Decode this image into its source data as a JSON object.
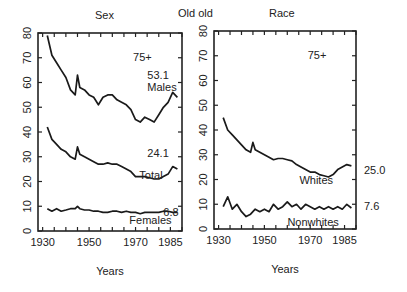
{
  "header": {
    "title": "Old old",
    "left_panel_title": "Sex",
    "right_panel_title": "Race"
  },
  "chart_data": [
    {
      "type": "line",
      "title": "Sex",
      "annotation": "75+",
      "xlabel": "Years",
      "ylabel": "",
      "xlim": [
        1928,
        1990
      ],
      "ylim": [
        0,
        80
      ],
      "xticks": [
        1930,
        1950,
        1970,
        1985
      ],
      "yticks": [
        0,
        10,
        20,
        30,
        40,
        50,
        60,
        70,
        80
      ],
      "grid": false,
      "x": [
        1932,
        1934,
        1936,
        1938,
        1940,
        1942,
        1944,
        1945,
        1946,
        1948,
        1950,
        1952,
        1954,
        1956,
        1958,
        1960,
        1962,
        1964,
        1966,
        1968,
        1970,
        1972,
        1974,
        1976,
        1978,
        1980,
        1982,
        1984,
        1986,
        1988
      ],
      "series": [
        {
          "name": "Males",
          "end_label": "53.1",
          "values": [
            79,
            71,
            68,
            65,
            62,
            57,
            55,
            63,
            58,
            57,
            55,
            54,
            51,
            54,
            55,
            55,
            53,
            52,
            51,
            49,
            45,
            44,
            46,
            45,
            44,
            47,
            50,
            52,
            56,
            54
          ]
        },
        {
          "name": "Total",
          "end_label": "24.1",
          "values": [
            42,
            37,
            35,
            33,
            32,
            30,
            29,
            34,
            31,
            30,
            29,
            28,
            27,
            27,
            27.5,
            27,
            27,
            26,
            25,
            24,
            22,
            22,
            22,
            21.5,
            21,
            21,
            22,
            23,
            26,
            25
          ]
        },
        {
          "name": "Females",
          "end_label": "6.8",
          "values": [
            9,
            8,
            9,
            8,
            8.5,
            9,
            9,
            10,
            9,
            8.5,
            8.5,
            8,
            8,
            7.5,
            7.5,
            8,
            8,
            7.5,
            8,
            7.5,
            7.5,
            7,
            7.5,
            7.5,
            7.5,
            7.5,
            8,
            8,
            7.5,
            7.5
          ]
        }
      ]
    },
    {
      "type": "line",
      "title": "Race",
      "annotation": "75+",
      "xlabel": "Years",
      "ylabel": "",
      "xlim": [
        1928,
        1990
      ],
      "ylim": [
        0,
        80
      ],
      "xticks": [
        1930,
        1950,
        1970,
        1985
      ],
      "yticks": [
        0,
        10,
        20,
        30,
        40,
        50,
        60,
        70,
        80
      ],
      "grid": false,
      "x": [
        1932,
        1934,
        1936,
        1938,
        1940,
        1942,
        1944,
        1945,
        1946,
        1948,
        1950,
        1952,
        1954,
        1956,
        1958,
        1960,
        1962,
        1964,
        1966,
        1968,
        1970,
        1972,
        1974,
        1976,
        1978,
        1980,
        1982,
        1984,
        1986,
        1988
      ],
      "series": [
        {
          "name": "Whites",
          "end_label": "25.0",
          "values": [
            45,
            40,
            38,
            36,
            34,
            32,
            31,
            35,
            32,
            31,
            30,
            29,
            28,
            28.5,
            28.5,
            28,
            27.5,
            26,
            25,
            24,
            23,
            23,
            22,
            21.5,
            21,
            22,
            24,
            25,
            26,
            25.5
          ]
        },
        {
          "name": "Nonwhites",
          "end_label": "7.6",
          "values": [
            9,
            13,
            8,
            10,
            7,
            5,
            6,
            7,
            8,
            7,
            8,
            7,
            10,
            8,
            9,
            11,
            9,
            10,
            8,
            10,
            9,
            8,
            9,
            8,
            9,
            8,
            9,
            8,
            10,
            8.5
          ]
        }
      ]
    }
  ]
}
